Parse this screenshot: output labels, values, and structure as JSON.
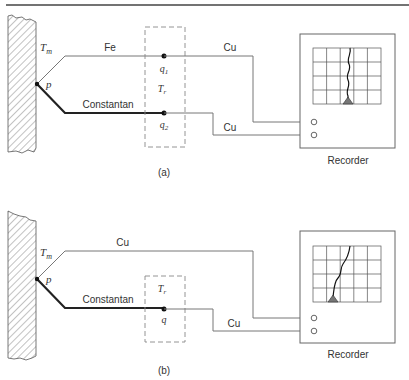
{
  "diagram": {
    "colors": {
      "wire": "#777777",
      "thick_wire": "#222222",
      "rule": "#444444",
      "dashed": "#888888",
      "trace": "#111111",
      "pointer": "#777777",
      "grid": "#555555"
    },
    "panel_a": {
      "caption": "(a)",
      "measured_temp_label": "T",
      "measured_temp_sub": "m",
      "junction_label": "p",
      "wire_top_label": "Fe",
      "wire_bottom_label": "Constantan",
      "ref_temp_label": "T",
      "ref_temp_sub": "r",
      "ref_junction_1_label": "q",
      "ref_junction_1_sub": "1",
      "ref_junction_2_label": "q",
      "ref_junction_2_sub": "2",
      "lead_top_label": "Cu",
      "lead_bottom_label": "Cu",
      "recorder_label": "Recorder"
    },
    "panel_b": {
      "caption": "(b)",
      "measured_temp_label": "T",
      "measured_temp_sub": "m",
      "junction_label": "p",
      "wire_top_label": "Cu",
      "wire_bottom_label": "Constantan",
      "ref_temp_label": "T",
      "ref_temp_sub": "r",
      "ref_junction_label": "q",
      "lead_bottom_label": "Cu",
      "recorder_label": "Recorder"
    }
  }
}
